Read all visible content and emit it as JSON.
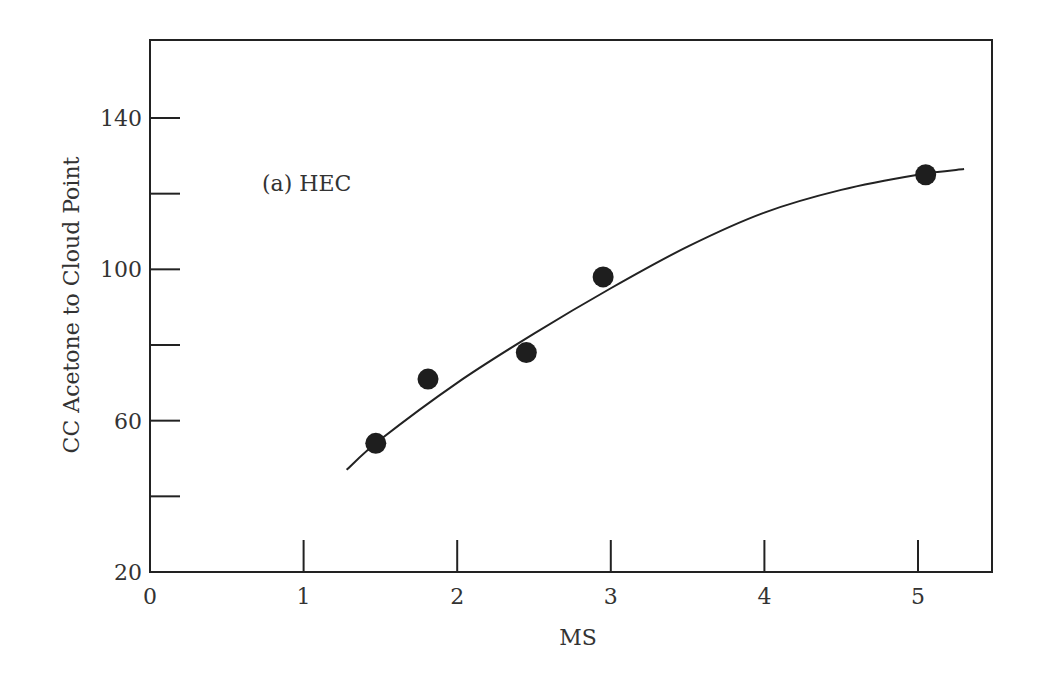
{
  "chart_data": {
    "type": "scatter",
    "title": "",
    "annotation": "(a)  HEC",
    "xlabel": "MS",
    "ylabel": "CC  Acetone  to  Cloud  Point",
    "xlim": [
      0,
      5.5
    ],
    "ylim": [
      20,
      160
    ],
    "x_ticks": [
      0,
      1,
      2,
      3,
      4,
      5
    ],
    "y_ticks": [
      20,
      40,
      60,
      80,
      100,
      120,
      140
    ],
    "y_tick_labels": [
      "20",
      "",
      "60",
      "",
      "100",
      "",
      "140"
    ],
    "grid": false,
    "series": [
      {
        "name": "HEC data",
        "marker": "filled-circle",
        "x": [
          1.47,
          1.81,
          2.45,
          2.95,
          5.05
        ],
        "y": [
          54,
          71,
          78,
          98,
          125
        ]
      },
      {
        "name": "HEC fit curve",
        "style": "line",
        "x": [
          1.28,
          1.5,
          2.0,
          2.5,
          3.0,
          3.5,
          4.0,
          4.5,
          5.0,
          5.3
        ],
        "y": [
          47,
          55,
          70,
          83,
          95,
          106,
          115,
          121,
          125,
          126.5
        ]
      }
    ]
  }
}
